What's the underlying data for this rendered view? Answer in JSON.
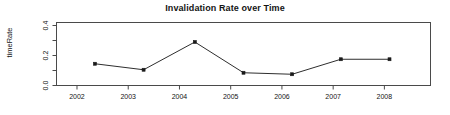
{
  "chart_data": {
    "type": "line",
    "title": "Invalidation Rate over Time",
    "xlabel": "",
    "ylabel": "timeRate",
    "x": [
      2002.35,
      2003.3,
      2004.3,
      2005.25,
      2006.2,
      2007.15,
      2008.1
    ],
    "values": [
      0.145,
      0.105,
      0.29,
      0.085,
      0.075,
      0.175,
      0.175
    ],
    "series": [
      {
        "name": "timeRate",
        "values": [
          0.145,
          0.105,
          0.29,
          0.085,
          0.075,
          0.175,
          0.175
        ]
      }
    ],
    "xlim": [
      2001.6,
      2008.9
    ],
    "ylim": [
      0.0,
      0.42
    ],
    "xticks": [
      2002,
      2003,
      2004,
      2005,
      2006,
      2007,
      2008
    ],
    "xtick_labels": [
      "2002",
      "2003",
      "2004",
      "2005",
      "2006",
      "2007",
      "2008"
    ],
    "yticks": [
      0.0,
      0.1,
      0.2,
      0.3,
      0.4
    ],
    "ytick_labels": [
      "0.0",
      "",
      "0.2",
      "",
      "0.4"
    ],
    "grid": false,
    "legend": false,
    "marker": "filled-square",
    "line_color": "#2e2e2e",
    "marker_color": "#1a1a1a",
    "axis_color": "#4a4a4a",
    "background": "#ffffff"
  },
  "axis": {
    "y_labels": [
      {
        "text": "0.4",
        "value": 0.4
      },
      {
        "text": "0.2",
        "value": 0.2
      },
      {
        "text": "0.0",
        "value": 0.0
      }
    ],
    "x_labels": [
      {
        "text": "2002",
        "value": 2002
      },
      {
        "text": "2003",
        "value": 2003
      },
      {
        "text": "2004",
        "value": 2004
      },
      {
        "text": "2005",
        "value": 2005
      },
      {
        "text": "2006",
        "value": 2006
      },
      {
        "text": "2007",
        "value": 2007
      },
      {
        "text": "2008",
        "value": 2008
      }
    ]
  }
}
